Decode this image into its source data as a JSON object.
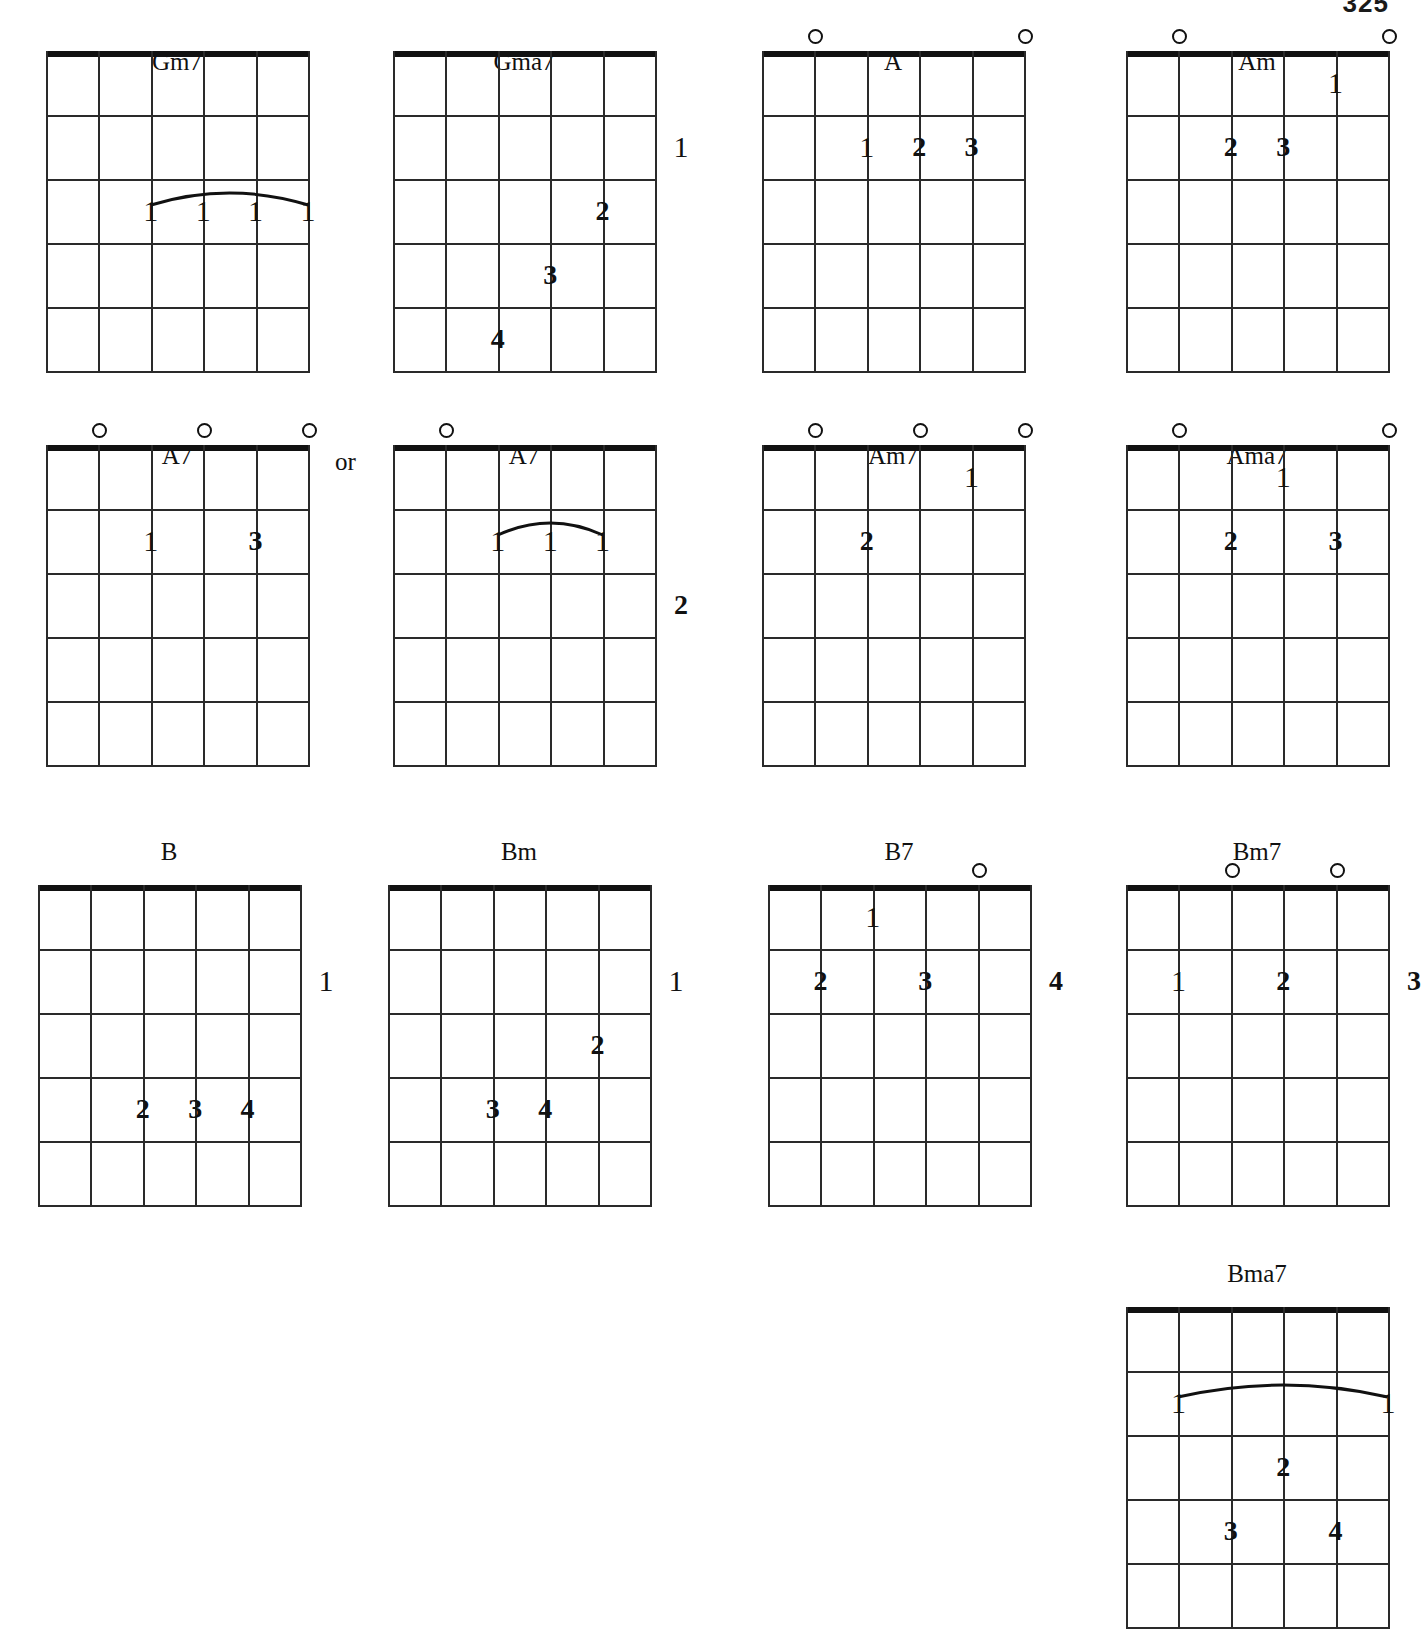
{
  "page": {
    "number": "325",
    "or_label": "or",
    "width": 1419,
    "height": 1554
  },
  "geometry": {
    "grid_width": 262,
    "grid_height": 320,
    "string_count": 6,
    "fret_count": 5,
    "string_gap": 52.4,
    "fret_gap": 64
  },
  "chords": [
    {
      "name": "Gm7",
      "x": 46,
      "y": 48,
      "grid_y": 51,
      "opens": [],
      "barre": {
        "fret": 3,
        "from_string": 3,
        "to_string": 6
      },
      "fingers": [
        {
          "label": "1",
          "string": 3,
          "fret": 3,
          "style": "thin"
        },
        {
          "label": "1",
          "string": 4,
          "fret": 3,
          "style": "thin"
        },
        {
          "label": "1",
          "string": 5,
          "fret": 3,
          "style": "thin"
        },
        {
          "label": "1",
          "string": 6,
          "fret": 3,
          "style": "thin"
        }
      ]
    },
    {
      "name": "Gma7",
      "x": 393,
      "y": 48,
      "grid_y": 51,
      "opens": [],
      "barre": null,
      "fingers": [
        {
          "label": "1",
          "string": 6,
          "fret": 2,
          "style": "thin",
          "edge": true
        },
        {
          "label": "2",
          "string": 5,
          "fret": 3,
          "style": "bold"
        },
        {
          "label": "3",
          "string": 4,
          "fret": 4,
          "style": "bold"
        },
        {
          "label": "4",
          "string": 3,
          "fret": 5,
          "style": "bold"
        }
      ]
    },
    {
      "name": "A",
      "x": 762,
      "y": 48,
      "grid_y": 51,
      "opens": [
        2,
        6
      ],
      "barre": null,
      "fingers": [
        {
          "label": "1",
          "string": 3,
          "fret": 2,
          "style": "thin"
        },
        {
          "label": "2",
          "string": 4,
          "fret": 2,
          "style": "bold"
        },
        {
          "label": "3",
          "string": 5,
          "fret": 2,
          "style": "bold"
        }
      ]
    },
    {
      "name": "Am",
      "x": 1126,
      "y": 48,
      "grid_y": 51,
      "opens": [
        2,
        6
      ],
      "barre": null,
      "fingers": [
        {
          "label": "1",
          "string": 5,
          "fret": 1,
          "style": "thin"
        },
        {
          "label": "2",
          "string": 3,
          "fret": 2,
          "style": "bold"
        },
        {
          "label": "3",
          "string": 4,
          "fret": 2,
          "style": "bold"
        }
      ]
    },
    {
      "name": "A7",
      "x": 46,
      "y": 442,
      "grid_y": 445,
      "opens": [
        2,
        4,
        6
      ],
      "barre": null,
      "fingers": [
        {
          "label": "1",
          "string": 3,
          "fret": 2,
          "style": "thin"
        },
        {
          "label": "3",
          "string": 5,
          "fret": 2,
          "style": "bold"
        }
      ]
    },
    {
      "name": "A7",
      "x": 393,
      "y": 442,
      "grid_y": 445,
      "opens": [
        2
      ],
      "barre": {
        "fret": 2,
        "from_string": 3,
        "to_string": 5
      },
      "fingers": [
        {
          "label": "1",
          "string": 3,
          "fret": 2,
          "style": "thin"
        },
        {
          "label": "1",
          "string": 4,
          "fret": 2,
          "style": "thin"
        },
        {
          "label": "1",
          "string": 5,
          "fret": 2,
          "style": "thin"
        },
        {
          "label": "2",
          "string": 6,
          "fret": 3,
          "style": "bold",
          "edge": true
        }
      ]
    },
    {
      "name": "Am7",
      "x": 762,
      "y": 442,
      "grid_y": 445,
      "opens": [
        2,
        4,
        6
      ],
      "barre": null,
      "fingers": [
        {
          "label": "1",
          "string": 5,
          "fret": 1,
          "style": "thin"
        },
        {
          "label": "2",
          "string": 3,
          "fret": 2,
          "style": "bold"
        }
      ]
    },
    {
      "name": "Ama7",
      "x": 1126,
      "y": 442,
      "grid_y": 445,
      "opens": [
        2,
        6
      ],
      "barre": null,
      "fingers": [
        {
          "label": "1",
          "string": 4,
          "fret": 1,
          "style": "thin"
        },
        {
          "label": "2",
          "string": 3,
          "fret": 2,
          "style": "bold"
        },
        {
          "label": "3",
          "string": 5,
          "fret": 2,
          "style": "bold"
        }
      ]
    },
    {
      "name": "B",
      "x": 38,
      "y": 838,
      "grid_y": 885,
      "opens": [],
      "barre": null,
      "fingers": [
        {
          "label": "1",
          "string": 6,
          "fret": 2,
          "style": "thin",
          "edge": true
        },
        {
          "label": "2",
          "string": 3,
          "fret": 4,
          "style": "bold"
        },
        {
          "label": "3",
          "string": 4,
          "fret": 4,
          "style": "bold"
        },
        {
          "label": "4",
          "string": 5,
          "fret": 4,
          "style": "bold"
        }
      ]
    },
    {
      "name": "Bm",
      "x": 388,
      "y": 838,
      "grid_y": 885,
      "opens": [],
      "barre": null,
      "fingers": [
        {
          "label": "1",
          "string": 6,
          "fret": 2,
          "style": "thin",
          "edge": true
        },
        {
          "label": "2",
          "string": 5,
          "fret": 3,
          "style": "bold"
        },
        {
          "label": "3",
          "string": 3,
          "fret": 4,
          "style": "bold"
        },
        {
          "label": "4",
          "string": 4,
          "fret": 4,
          "style": "bold"
        }
      ]
    },
    {
      "name": "B7",
      "x": 768,
      "y": 838,
      "grid_y": 885,
      "opens": [
        5
      ],
      "barre": null,
      "fingers": [
        {
          "label": "1",
          "string": 3,
          "fret": 1,
          "style": "thin"
        },
        {
          "label": "2",
          "string": 2,
          "fret": 2,
          "style": "bold"
        },
        {
          "label": "3",
          "string": 4,
          "fret": 2,
          "style": "bold"
        },
        {
          "label": "4",
          "string": 6,
          "fret": 2,
          "style": "bold",
          "edge": true
        }
      ]
    },
    {
      "name": "Bm7",
      "x": 1126,
      "y": 838,
      "grid_y": 885,
      "opens": [
        3,
        5
      ],
      "barre": null,
      "fingers": [
        {
          "label": "1",
          "string": 2,
          "fret": 2,
          "style": "thin"
        },
        {
          "label": "2",
          "string": 4,
          "fret": 2,
          "style": "bold"
        },
        {
          "label": "3",
          "string": 6,
          "fret": 2,
          "style": "bold",
          "edge": true
        }
      ]
    },
    {
      "name": "Bma7",
      "x": 1126,
      "y": 1260,
      "grid_y": 1307,
      "opens": [],
      "barre": {
        "fret": 2,
        "from_string": 2,
        "to_string": 6
      },
      "fingers": [
        {
          "label": "1",
          "string": 2,
          "fret": 2,
          "style": "thin"
        },
        {
          "label": "1",
          "string": 6,
          "fret": 2,
          "style": "thin"
        },
        {
          "label": "2",
          "string": 4,
          "fret": 3,
          "style": "bold"
        },
        {
          "label": "3",
          "string": 3,
          "fret": 4,
          "style": "bold"
        },
        {
          "label": "4",
          "string": 5,
          "fret": 4,
          "style": "bold"
        }
      ]
    }
  ],
  "or_marker": {
    "x": 335,
    "y": 448
  }
}
